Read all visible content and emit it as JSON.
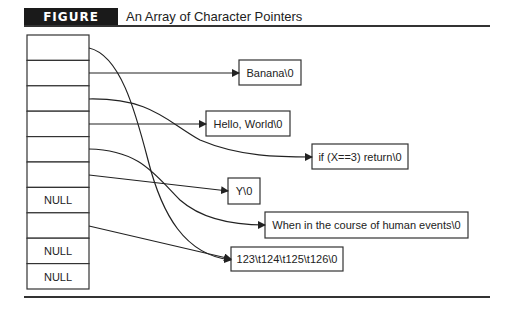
{
  "figure": {
    "label": "FIGURE 10.2",
    "title": "An Array of Character Pointers"
  },
  "array": {
    "cells": [
      "",
      "",
      "",
      "",
      "",
      "",
      "NULL",
      "",
      "NULL",
      "NULL"
    ]
  },
  "strings": [
    {
      "id": "banana",
      "text": "Banana\\0"
    },
    {
      "id": "hello",
      "text": "Hello, World\\0"
    },
    {
      "id": "if",
      "text": "if (X==3) return\\0"
    },
    {
      "id": "y",
      "text": "Y\\0"
    },
    {
      "id": "when",
      "text": "When in the course of human events\\0"
    },
    {
      "id": "nums",
      "text": "123\\t124\\t125\\t126\\0"
    }
  ],
  "pointers": [
    {
      "from_cell": 0,
      "to": "nums"
    },
    {
      "from_cell": 1,
      "to": "banana"
    },
    {
      "from_cell": 2,
      "to": "if"
    },
    {
      "from_cell": 3,
      "to": "hello"
    },
    {
      "from_cell": 4,
      "to": "when"
    },
    {
      "from_cell": 5,
      "to": "y"
    },
    {
      "from_cell": 7,
      "to": "nums"
    }
  ]
}
